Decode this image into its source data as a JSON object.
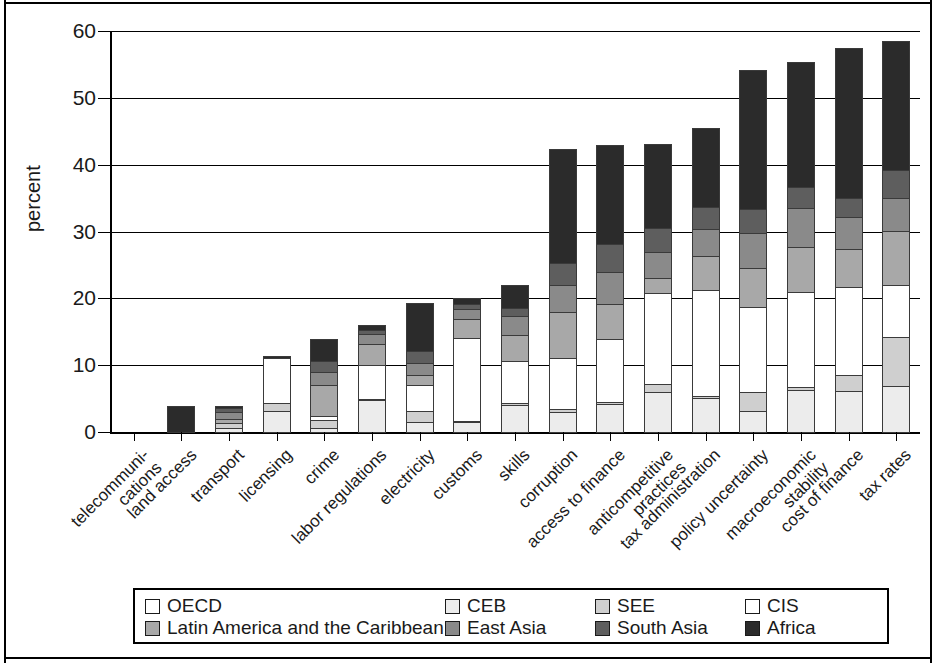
{
  "chart_data": {
    "type": "bar",
    "subtype": "stacked-bar",
    "title": "",
    "xlabel": "",
    "ylabel": "percent",
    "ylim": [
      0,
      60
    ],
    "yticks": [
      0,
      10,
      20,
      30,
      40,
      50,
      60
    ],
    "grid": true,
    "legend_position": "bottom",
    "categories": [
      "telecommuni-\ncations",
      "land access",
      "transport",
      "licensing",
      "crime",
      "labor regulations",
      "electricity",
      "customs",
      "skills",
      "corruption",
      "access to finance",
      "anticompetitive\npractices",
      "tax administration",
      "policy uncertainty",
      "macroeconomic\nstability",
      "cost of finance",
      "tax rates"
    ],
    "series": [
      {
        "name": "OECD",
        "color": "#ffffff",
        "values": [
          0,
          0,
          0,
          0,
          0,
          0,
          0,
          0,
          0,
          0,
          0,
          0,
          0,
          0,
          0,
          0,
          0
        ]
      },
      {
        "name": "CEB",
        "color": "#ececec",
        "values": [
          0,
          0,
          0.8,
          3.3,
          0.7,
          5.0,
          1.6,
          1.6,
          4.2,
          3.2,
          4.3,
          6.1,
          5.2,
          3.3,
          6.4,
          6.3,
          7.0
        ]
      },
      {
        "name": "SEE",
        "color": "#cfcfcf",
        "values": [
          0,
          0,
          0.8,
          1.3,
          1.4,
          0.3,
          1.8,
          0.4,
          0.4,
          0.5,
          0.5,
          1.4,
          0.5,
          3.0,
          0.7,
          2.5,
          7.5
        ]
      },
      {
        "name": "CIS",
        "color": "#ffffff",
        "values": [
          0,
          0,
          0,
          6.9,
          0.7,
          5.2,
          4.1,
          12.5,
          6.5,
          7.8,
          9.5,
          13.8,
          16.0,
          12.9,
          14.3,
          13.3,
          8.0
        ]
      },
      {
        "name": "Latin America and the Caribbean",
        "color": "#a8a8a8",
        "values": [
          0,
          0,
          0.8,
          0,
          4.8,
          3.2,
          1.6,
          3.0,
          4.0,
          7.0,
          5.4,
          2.4,
          5.3,
          6.0,
          6.9,
          5.9,
          8.2
        ]
      },
      {
        "name": "East Asia",
        "color": "#8a8a8a",
        "values": [
          0,
          0,
          1.2,
          0,
          2.2,
          1.7,
          2.0,
          1.6,
          3.0,
          4.2,
          5.0,
          4.0,
          4.1,
          5.4,
          6.0,
          4.9,
          5.1
        ]
      },
      {
        "name": "South Asia",
        "color": "#5e5e5e",
        "values": [
          0,
          0,
          0.8,
          0,
          1.7,
          0.7,
          2.0,
          1.0,
          1.4,
          3.5,
          4.3,
          3.8,
          3.5,
          3.6,
          3.3,
          3.0,
          4.3
        ]
      },
      {
        "name": "Africa",
        "color": "#2b2b2b",
        "values": [
          0,
          4.1,
          0.4,
          0.5,
          3.5,
          0.9,
          7.2,
          1.0,
          3.5,
          17.2,
          15.0,
          12.6,
          11.9,
          21.0,
          18.8,
          22.6,
          19.4
        ]
      }
    ],
    "totals": [
      0,
      4.1,
      4.8,
      12.0,
      15.0,
      17.0,
      20.3,
      21.1,
      23.0,
      43.4,
      44.0,
      44.1,
      46.5,
      55.2,
      56.4,
      58.5,
      59.5
    ]
  },
  "legend": {
    "items": [
      {
        "label": "OECD",
        "color": "#ffffff"
      },
      {
        "label": "CEB",
        "color": "#ececec"
      },
      {
        "label": "SEE",
        "color": "#cfcfcf"
      },
      {
        "label": "CIS",
        "color": "#ffffff"
      },
      {
        "label": "Latin America and the Caribbean",
        "color": "#a8a8a8"
      },
      {
        "label": "East Asia",
        "color": "#8a8a8a"
      },
      {
        "label": "South Asia",
        "color": "#5e5e5e"
      },
      {
        "label": "Africa",
        "color": "#2b2b2b"
      }
    ]
  }
}
